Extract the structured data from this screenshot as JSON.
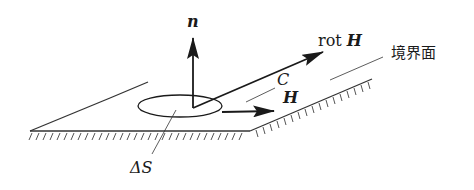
{
  "figure": {
    "type": "boundary-surface-diagram",
    "labels": {
      "normal": "n",
      "rot_prefix": "rot",
      "rot_vector": "H",
      "contour": "C",
      "field": "H",
      "area": "ΔS",
      "boundary": "境界面"
    },
    "colors": {
      "ink": "#1a1a1a",
      "hatch": "#555555",
      "background": "#ffffff"
    }
  }
}
